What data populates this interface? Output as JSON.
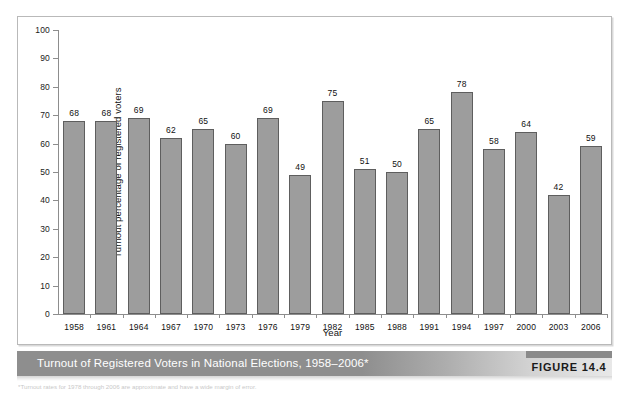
{
  "figure": {
    "caption": "Turnout of Registered Voters in National Elections, 1958–2006*",
    "label": "FIGURE 14.4",
    "footnote": "*Turnout rates for 1978 through 2006 are approximate and have a wide margin of error.",
    "colors": {
      "bar_fill": "#9d9d9d",
      "bar_stroke": "#5e5e5e",
      "axis": "#8d8d8d",
      "caption_band": "#8e8e8e",
      "caption_text": "#ffffff",
      "frame_border": "#b9b9b9"
    }
  },
  "chart_data": {
    "type": "bar",
    "title": "Turnout of Registered Voters in National Elections, 1958–2006*",
    "xlabel": "Year",
    "ylabel": "Turnout percentage of registered voters",
    "ylim": [
      0,
      100
    ],
    "ytick_step": 10,
    "grid": false,
    "legend": "none",
    "categories": [
      "1958",
      "1961",
      "1964",
      "1967",
      "1970",
      "1973",
      "1976",
      "1979",
      "1982",
      "1985",
      "1988",
      "1991",
      "1994",
      "1997",
      "2000",
      "2003",
      "2006"
    ],
    "values": [
      68,
      68,
      69,
      62,
      65,
      60,
      69,
      49,
      75,
      51,
      50,
      65,
      78,
      58,
      64,
      42,
      59
    ],
    "yticks": [
      "0",
      "10",
      "20",
      "30",
      "40",
      "50",
      "60",
      "70",
      "80",
      "90",
      "100"
    ]
  }
}
